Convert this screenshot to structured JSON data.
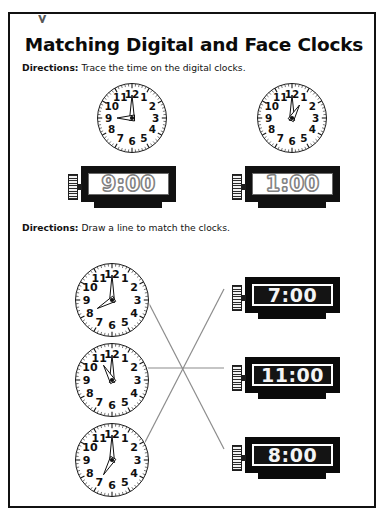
{
  "page": {
    "title": "Matching Digital and Face Clocks",
    "artifact_glyph": "y",
    "border_color": "#111111",
    "background": "#ffffff"
  },
  "sections": [
    {
      "name": "trace-section",
      "directions_label": "Directions:",
      "directions_text": "Trace the time on the digital clocks.",
      "analog_clocks": [
        {
          "id": "trace-clock-1",
          "time": "9:00",
          "hour": 9,
          "minute": 0
        },
        {
          "id": "trace-clock-2",
          "time": "1:00",
          "hour": 1,
          "minute": 0
        }
      ],
      "digital_clocks": [
        {
          "id": "trace-digital-1",
          "time": "9:00",
          "style": "outline"
        },
        {
          "id": "trace-digital-2",
          "time": "1:00",
          "style": "outline"
        }
      ]
    },
    {
      "name": "matching-section",
      "directions_label": "Directions:",
      "directions_text": "Draw a line to match the clocks.",
      "analog_clocks": [
        {
          "id": "match-clock-1",
          "time": "8:00",
          "hour": 8,
          "minute": 0
        },
        {
          "id": "match-clock-2",
          "time": "11:00",
          "hour": 11,
          "minute": 0
        },
        {
          "id": "match-clock-3",
          "time": "7:00",
          "hour": 7,
          "minute": 0
        }
      ],
      "digital_clocks": [
        {
          "id": "match-digital-1",
          "time": "7:00",
          "style": "solid"
        },
        {
          "id": "match-digital-2",
          "time": "11:00",
          "style": "solid"
        },
        {
          "id": "match-digital-3",
          "time": "8:00",
          "style": "solid"
        }
      ],
      "connections": [
        {
          "from": "match-clock-1",
          "to": "match-digital-3",
          "time": "8:00"
        },
        {
          "from": "match-clock-2",
          "to": "match-digital-2",
          "time": "11:00"
        },
        {
          "from": "match-clock-3",
          "to": "match-digital-1",
          "time": "7:00"
        }
      ],
      "line_color": "#8c8c8c"
    }
  ],
  "clock_face": {
    "numerals": [
      "12",
      "1",
      "2",
      "3",
      "4",
      "5",
      "6",
      "7",
      "8",
      "9",
      "10",
      "11"
    ],
    "tick_count": 60,
    "outline_color": "#1a1a1a",
    "hand_style": "hollow-outline"
  }
}
